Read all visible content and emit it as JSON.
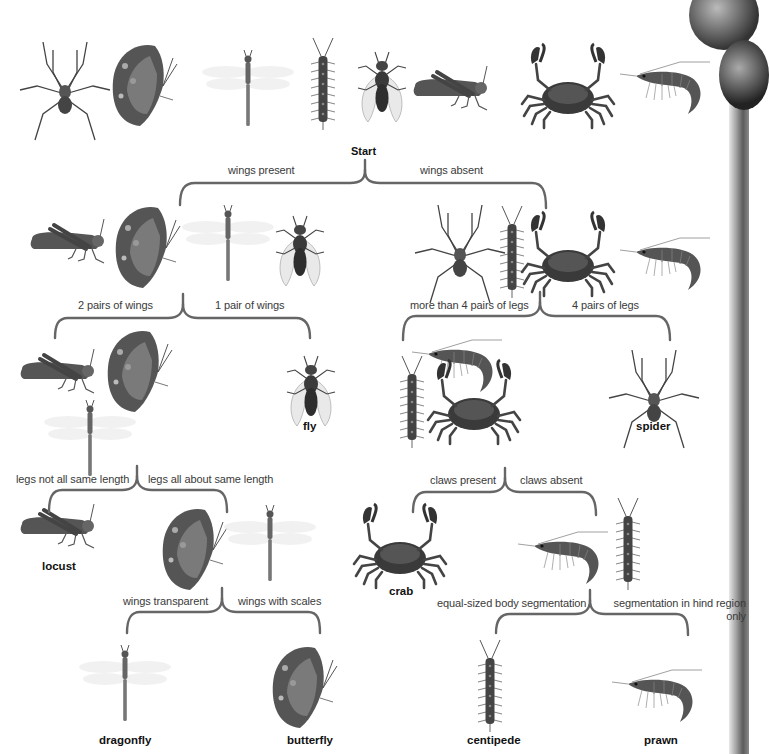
{
  "diagram": {
    "type": "dichotomous-key",
    "start_label": "Start",
    "bracket_color": "#666666",
    "top_row_animals": [
      "spider",
      "butterfly",
      "dragonfly",
      "centipede",
      "fly",
      "locust",
      "crab",
      "prawn"
    ],
    "levels": {
      "root": {
        "left": "wings present",
        "right": "wings absent"
      },
      "winged": {
        "left": "2 pairs of wings",
        "right": "1 pair of wings",
        "group": [
          "locust",
          "butterfly",
          "dragonfly",
          "fly"
        ]
      },
      "wingless": {
        "left": "more than 4 pairs of legs",
        "right": "4 pairs of legs",
        "group": [
          "spider",
          "centipede",
          "crab",
          "prawn"
        ]
      },
      "two_pairs": {
        "left": "legs not all same length",
        "right": "legs all about same length",
        "group": [
          "locust",
          "butterfly",
          "dragonfly"
        ]
      },
      "many_legs": {
        "left": "claws present",
        "right": "claws absent",
        "group": [
          "prawn",
          "centipede",
          "crab"
        ]
      },
      "same_length": {
        "left": "wings transparent",
        "right": "wings with scales",
        "group": [
          "butterfly",
          "dragonfly"
        ]
      },
      "no_claws": {
        "left": "equal-sized body segmentation",
        "right": "segmentation in hind region only",
        "group": [
          "prawn",
          "centipede"
        ]
      }
    },
    "results": {
      "fly": "fly",
      "spider": "spider",
      "locust": "locust",
      "crab": "crab",
      "dragonfly": "dragonfly",
      "butterfly": "butterfly",
      "centipede": "centipede",
      "prawn": "prawn"
    }
  }
}
